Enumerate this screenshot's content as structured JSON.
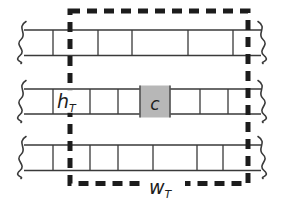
{
  "diagram": {
    "labels": {
      "cell_height": {
        "base": "h",
        "sub": "T"
      },
      "center_cell": "c",
      "window_width": {
        "base": "w",
        "sub": "T"
      }
    },
    "colors": {
      "line": "#3a3a3a",
      "dash": "#1c1c1c",
      "cell_fill": "#b7b7b7",
      "background": "#ffffff"
    }
  }
}
